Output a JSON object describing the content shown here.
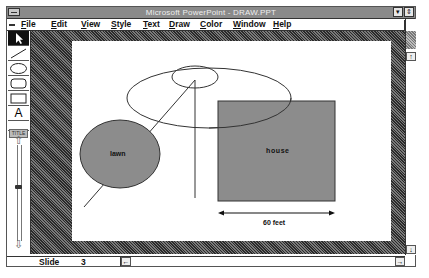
{
  "window": {
    "title": "Microsoft PowerPoint - DRAW.PPT",
    "controls": {
      "minimize": "▾",
      "restore": "⇕"
    }
  },
  "menubar": {
    "items": [
      {
        "label": "File",
        "accel": "F"
      },
      {
        "label": "Edit",
        "accel": "E"
      },
      {
        "label": "View",
        "accel": "V"
      },
      {
        "label": "Style",
        "accel": "S"
      },
      {
        "label": "Text",
        "accel": "T"
      },
      {
        "label": "Draw",
        "accel": "D"
      },
      {
        "label": "Color",
        "accel": "C"
      },
      {
        "label": "Window",
        "accel": "W"
      },
      {
        "label": "Help",
        "accel": "H"
      }
    ],
    "doc_restore": "⇕"
  },
  "toolbar": {
    "tools": [
      {
        "name": "arrow-select",
        "selected": true
      },
      {
        "name": "line"
      },
      {
        "name": "ellipse"
      },
      {
        "name": "rounded-rectangle"
      },
      {
        "name": "rectangle"
      },
      {
        "name": "text",
        "glyph": "A"
      },
      {
        "name": "title-text",
        "glyph": "TITLE"
      }
    ],
    "zoom_slider": {
      "up": "⇧",
      "down": "⇩"
    }
  },
  "slide": {
    "labels": {
      "lawn": "lawn",
      "house": "house",
      "dimension": "60 feet"
    },
    "colors": {
      "fill": "#8c8c8c",
      "stroke": "#333333",
      "background": "#ffffff"
    }
  },
  "statusbar": {
    "slide_label": "Slide",
    "slide_number": "3",
    "prev_arrow": "←",
    "next_arrow": "→"
  },
  "scrollbar": {
    "up": "↑",
    "down": "↓"
  }
}
